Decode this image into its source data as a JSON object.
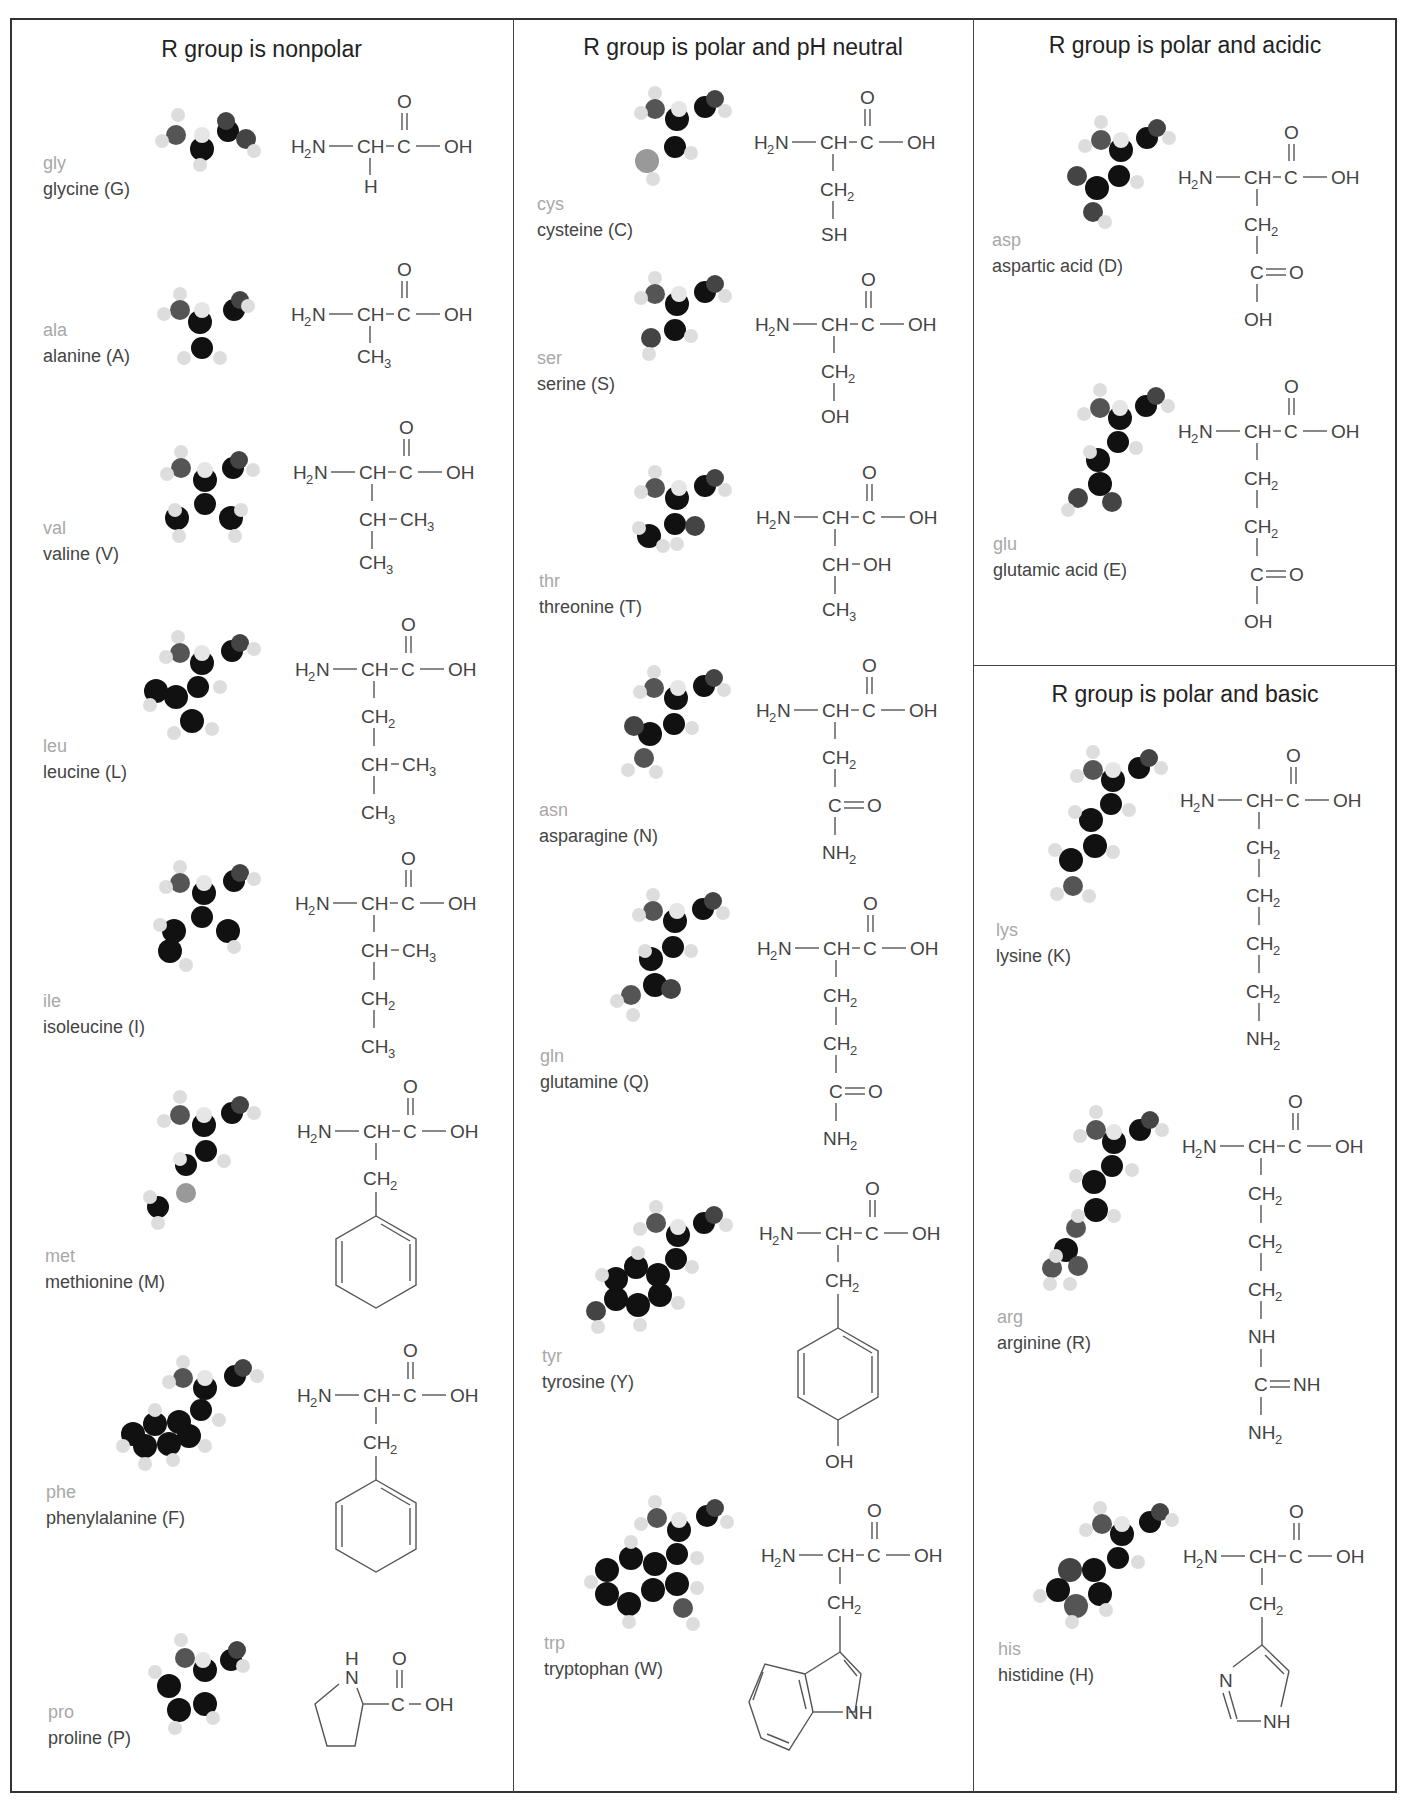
{
  "sections": {
    "nonpolar": {
      "title": "R group is nonpolar"
    },
    "neutral": {
      "title": "R group is polar and pH neutral"
    },
    "acidic": {
      "title": "R group is polar and acidic"
    },
    "basic": {
      "title": "R group is polar and basic"
    }
  },
  "common": {
    "h2n": "H",
    "n": "N",
    "sub2": "2",
    "sub3": "3",
    "ch": "CH",
    "c": "C",
    "oh": "OH",
    "o": "O",
    "h": "H",
    "dash": "–"
  },
  "amino_acids": {
    "gly": {
      "abbr": "gly",
      "name": "glycine (G)",
      "side_chain": [
        "H"
      ]
    },
    "ala": {
      "abbr": "ala",
      "name": "alanine (A)",
      "side_chain": [
        "CH3"
      ]
    },
    "val": {
      "abbr": "val",
      "name": "valine (V)",
      "side_chain": [
        "CH–CH3",
        "CH3"
      ]
    },
    "leu": {
      "abbr": "leu",
      "name": "leucine (L)",
      "side_chain": [
        "CH2",
        "CH–CH3",
        "CH3"
      ]
    },
    "ile": {
      "abbr": "ile",
      "name": "isoleucine (I)",
      "side_chain": [
        "CH–CH3",
        "CH2",
        "CH3"
      ]
    },
    "met": {
      "abbr": "met",
      "name": "methionine (M)",
      "side_chain": [
        "CH2",
        "benzene ring"
      ]
    },
    "phe": {
      "abbr": "phe",
      "name": "phenylalanine (F)",
      "side_chain": [
        "CH2",
        "benzene ring"
      ]
    },
    "pro": {
      "abbr": "pro",
      "name": "proline (P)",
      "side_chain": [
        "pyrrolidine ring (NH)",
        "C(=O)–OH"
      ]
    },
    "cys": {
      "abbr": "cys",
      "name": "cysteine (C)",
      "side_chain": [
        "CH2",
        "SH"
      ]
    },
    "ser": {
      "abbr": "ser",
      "name": "serine (S)",
      "side_chain": [
        "CH2",
        "OH"
      ]
    },
    "thr": {
      "abbr": "thr",
      "name": "threonine (T)",
      "side_chain": [
        "CH–OH",
        "CH3"
      ]
    },
    "asn": {
      "abbr": "asn",
      "name": "asparagine (N)",
      "side_chain": [
        "CH2",
        "C=O",
        "NH2"
      ]
    },
    "gln": {
      "abbr": "gln",
      "name": "glutamine (Q)",
      "side_chain": [
        "CH2",
        "CH2",
        "C=O",
        "NH2"
      ]
    },
    "tyr": {
      "abbr": "tyr",
      "name": "tyrosine (Y)",
      "side_chain": [
        "CH2",
        "phenol ring",
        "OH"
      ]
    },
    "trp": {
      "abbr": "trp",
      "name": "tryptophan (W)",
      "side_chain": [
        "CH2",
        "indole ring",
        "NH"
      ]
    },
    "asp": {
      "abbr": "asp",
      "name": "aspartic acid (D)",
      "side_chain": [
        "CH2",
        "C=O",
        "OH"
      ]
    },
    "glu": {
      "abbr": "glu",
      "name": "glutamic acid (E)",
      "side_chain": [
        "CH2",
        "CH2",
        "C=O",
        "OH"
      ]
    },
    "lys": {
      "abbr": "lys",
      "name": "lysine (K)",
      "side_chain": [
        "CH2",
        "CH2",
        "CH2",
        "CH2",
        "NH2"
      ]
    },
    "arg": {
      "abbr": "arg",
      "name": "arginine (R)",
      "side_chain": [
        "CH2",
        "CH2",
        "CH2",
        "NH",
        "C=NH",
        "NH2"
      ]
    },
    "his": {
      "abbr": "his",
      "name": "histidine (H)",
      "side_chain": [
        "CH2",
        "imidazole ring (N, NH)"
      ]
    }
  },
  "atom_labels": {
    "sh": "SH",
    "nh": "NH",
    "nh2_n": "NH",
    "n": "N",
    "eq_o": "O",
    "eq_nh": "NH",
    "oh": "OH",
    "ch_oh": "CH–OH",
    "ch_ch3": "CH–CH"
  },
  "colors": {
    "border": "#333333",
    "abbr": "#a8a8a8",
    "name": "#444444",
    "formula": "#444444",
    "carbon": "#111111",
    "hydrogen": "#e8e8e8",
    "nitrogen": "#555555",
    "oxygen": "#3a3a3a",
    "sulfur": "#9a9a9a"
  }
}
